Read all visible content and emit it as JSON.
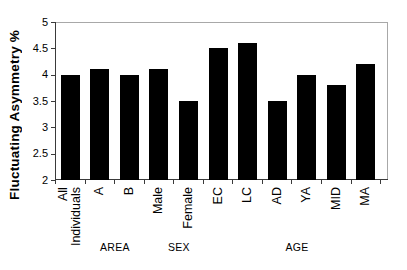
{
  "chart_data": {
    "type": "bar",
    "title": "",
    "ylabel": "Fluctuating Asymmetry %",
    "xlabel": "",
    "categories": [
      "All\nIndividuals",
      "A",
      "B",
      "Male",
      "Female",
      "EC",
      "LC",
      "AD",
      "YA",
      "MID",
      "MA"
    ],
    "values": [
      4.0,
      4.1,
      4.0,
      4.1,
      3.5,
      4.5,
      4.6,
      3.5,
      4.0,
      3.8,
      4.2
    ],
    "ylim": [
      2,
      5
    ],
    "yticks": [
      5,
      4.5,
      4,
      3.5,
      3,
      2.5,
      2
    ],
    "ytick_labels": [
      "5",
      "4.5",
      "4",
      "3.5",
      "3",
      "2.5",
      "2"
    ],
    "bar_color": "#000000",
    "grid": false,
    "legend": "none",
    "groups": [
      {
        "label": "AREA",
        "span": [
          "A",
          "B"
        ],
        "x_center_px": 115
      },
      {
        "label": "SEX",
        "span": [
          "Male",
          "Female"
        ],
        "x_center_px": 179
      },
      {
        "label": "AGE",
        "span": [
          "AD",
          "YA",
          "MID",
          "MA"
        ],
        "x_center_px": 297
      }
    ]
  }
}
